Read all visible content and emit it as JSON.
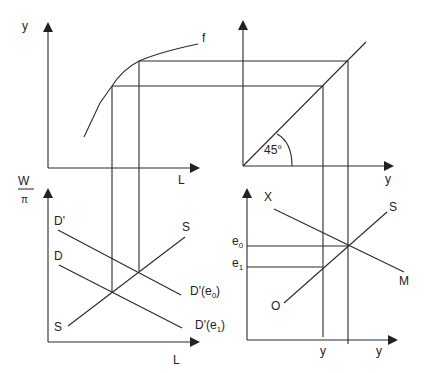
{
  "diagram": {
    "top_left": {
      "y_axis_label": "y",
      "x_axis_label": "L",
      "curve_label": "f"
    },
    "top_right": {
      "x_axis_label": "y",
      "angle_label": "45°"
    },
    "bottom_left": {
      "y_axis_label_num": "W",
      "y_axis_label_den": "π",
      "x_axis_label": "L",
      "curve_D_prime_label": "D'",
      "curve_D_label": "D",
      "supply_top_label": "S",
      "supply_bottom_label": "S",
      "demand_e0_label_main": "D'(e",
      "demand_e0_sub": "0",
      "demand_e1_label_main": "D'(e",
      "demand_e1_sub": "1",
      "close_paren": ")"
    },
    "bottom_right": {
      "curve_X_label": "X",
      "curve_M_label": "M",
      "curve_S_label": "S",
      "curve_O_label": "O",
      "e0_main": "e",
      "e0_sub": "0",
      "e1_main": "e",
      "e1_sub": "1",
      "x_tick_label": "y",
      "x_axis_label": "y"
    }
  }
}
